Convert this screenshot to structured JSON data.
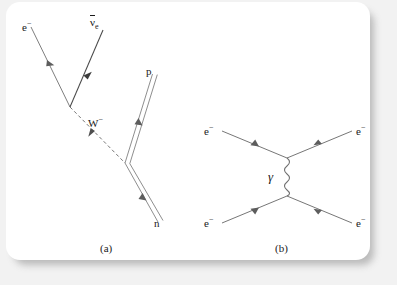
{
  "figure": {
    "background_color": "#f2f2f2",
    "card_color": "#ffffff",
    "line_color": "#6b6b6b",
    "text_color": "#1a1a1a"
  },
  "panel_a": {
    "caption": "(a)",
    "description": "Beta decay Feynman diagram: neutron decays to proton emitting a W-minus boson which produces an electron and an electron antineutrino",
    "labels": {
      "electron": "e",
      "electron_charge": "−",
      "antineutrino": "ν",
      "antineutrino_sub": "e",
      "boson": "W",
      "boson_charge": "−",
      "proton": "p",
      "neutron": "n"
    },
    "vertices": {
      "lepton_vertex": [
        70,
        107
      ],
      "nucleon_vertex": [
        125,
        163
      ]
    },
    "lines": [
      {
        "name": "electron-line",
        "style": "solid",
        "from": [
          31,
          27
        ],
        "to": [
          70,
          107
        ],
        "arrow_at": 0.52
      },
      {
        "name": "antineutrino-line",
        "style": "solid",
        "from": [
          70,
          107
        ],
        "to": [
          103,
          30
        ],
        "arrow_at": 0.55
      },
      {
        "name": "w-boson-line",
        "style": "dashed",
        "from": [
          70,
          107
        ],
        "to": [
          125,
          163
        ],
        "arrow_at": 0.58
      },
      {
        "name": "proton-double-line",
        "style": "double",
        "from": [
          125,
          163
        ],
        "to": [
          152,
          74
        ],
        "arrow_at": 0.52
      },
      {
        "name": "neutron-double-line",
        "style": "double",
        "from": [
          158,
          222
        ],
        "to": [
          125,
          163
        ],
        "arrow_at": 0.45
      }
    ]
  },
  "panel_b": {
    "caption": "(b)",
    "description": "Moller scattering Feynman diagram: two electrons exchange a virtual photon",
    "labels": {
      "electron_in_top": "e",
      "electron_in_top_charge": "−",
      "electron_in_bottom": "e",
      "electron_in_bottom_charge": "−",
      "electron_out_top": "e",
      "electron_out_top_charge": "−",
      "electron_out_bottom": "e",
      "electron_out_bottom_charge": "−",
      "photon": "γ"
    },
    "vertices": {
      "top_vertex": [
        287,
        158
      ],
      "bottom_vertex": [
        287,
        196
      ]
    },
    "lines": [
      {
        "name": "electron-in-top-line",
        "style": "solid",
        "from": [
          222,
          131
        ],
        "to": [
          287,
          158
        ],
        "arrow_at": 0.55
      },
      {
        "name": "electron-out-top-line",
        "style": "solid",
        "from": [
          287,
          158
        ],
        "to": [
          352,
          131
        ],
        "arrow_at": 0.5
      },
      {
        "name": "electron-in-bottom-line",
        "style": "solid",
        "from": [
          222,
          223
        ],
        "to": [
          287,
          196
        ],
        "arrow_at": 0.55
      },
      {
        "name": "electron-out-bottom-line",
        "style": "solid",
        "from": [
          287,
          196
        ],
        "to": [
          352,
          223
        ],
        "arrow_at": 0.5
      },
      {
        "name": "photon-wavy-line",
        "style": "wavy",
        "from": [
          287,
          158
        ],
        "to": [
          287,
          196
        ],
        "cycles": 5
      }
    ]
  }
}
